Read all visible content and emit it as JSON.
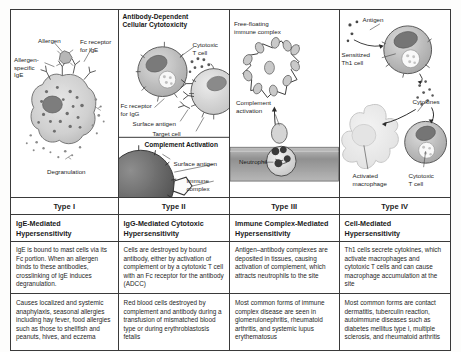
{
  "figure": {
    "kind": "hypersensitivity-comparison-table",
    "columns": [
      {
        "type_label": "Type I",
        "name": "IgE-Mediated\nHypersensitivity",
        "mechanism": "IgE is bound to mast cells via its Fc portion. When an allergen binds to these antibodies, crosslinking of IgE induces degranulation.",
        "examples": "Causes localized and systemic anaphylaxis, seasonal allergies including hay fever, food allergies such as those to shellfish and peanuts, hives, and eczema",
        "diagram": {
          "title": "",
          "labels": [
            "Allergen",
            "Fc receptor\nfor IgE",
            "Allergen-\nspecific\nIgE",
            "Degranulation"
          ]
        }
      },
      {
        "type_label": "Type II",
        "name": "IgG-Mediated Cytotoxic\nHypersensitivity",
        "mechanism": "Cells are destroyed by bound antibody, either by activation of complement or by a cytotoxic T cell with an Fc receptor for the antibody (ADCC)",
        "examples": "Red blood cells destroyed by complement and antibody during a transfusion of mismatched blood type or during erythroblastosis fetalis",
        "diagram": {
          "title": "Antibody-Dependent\nCellular Cytotoxicity",
          "subtitle": "Complement Activation",
          "labels": [
            "Cytotoxic\nT cell",
            "Fc receptor\nfor IgG",
            "Surface antigen",
            "Target cell",
            "Surface antigen",
            "Immune\ncomplex"
          ]
        }
      },
      {
        "type_label": "Type III",
        "name": "Immune Complex-Mediated\nHypersensitivity",
        "mechanism": "Antigen–antibody complexes are deposited in tissues, causing activation of complement, which attracts neutrophils to the site",
        "examples": "Most common forms of immune complex disease are seen in glomerulonephritis, rheumatoid arthritis, and systemic lupus erythematosus",
        "diagram": {
          "title": "",
          "labels": [
            "Free-floating\nimmune complex",
            "Complement\nactivation",
            "Neutrophil"
          ]
        }
      },
      {
        "type_label": "Type IV",
        "name": "Cell-Mediated\nHypersensitivity",
        "mechanism": "Th1 cells secrete cytokines, which activate macrophages and cytotoxic T cells and can cause macrophage accumulation at the site",
        "examples": "Most common forms are contact dermatitis, tuberculin reaction, autoimmune diseases such as diabetes mellitus type I, multiple sclerosis, and rheumatoid arthritis",
        "diagram": {
          "title": "",
          "labels": [
            "Antigen",
            "Sensitized\nTh1 cell",
            "Cytokines",
            "Activated\nmacrophage",
            "Cytotoxic\nT cell"
          ]
        }
      }
    ]
  },
  "colors": {
    "border": "#3a3a3a",
    "text": "#1a1a1a",
    "cell_fill": "#cfcfcf",
    "cell_fill_dark": "#9a9a9a",
    "nucleus": "#6e6e6e",
    "vessel": "#a8a8a8",
    "background": "#ffffff"
  }
}
